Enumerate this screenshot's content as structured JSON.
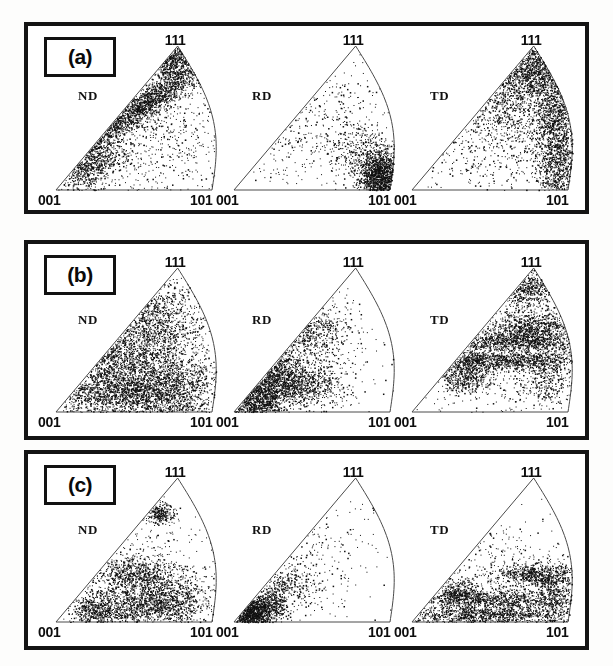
{
  "figure": {
    "type": "inverse-pole-figure-grid",
    "rows": 3,
    "columns": 3,
    "background_color": "#ffffff",
    "frame_color": "#141414",
    "point_color": "#101010"
  },
  "corner_labels": {
    "top": "111",
    "bottom_left": "001",
    "bottom_right": "101"
  },
  "directions": [
    "ND",
    "RD",
    "TD"
  ],
  "panels": [
    {
      "tag": "(a)",
      "plots": [
        {
          "direction": "ND",
          "corner_top": "111",
          "corner_left": "001",
          "corner_right": "101",
          "description": "dense band along the 001-111 edge, saturated near 111 apex, sparse interior"
        },
        {
          "direction": "RD",
          "corner_top": "111",
          "corner_left": "001",
          "corner_right": "101",
          "description": "intense concentration at the 101 corner, very sparse elsewhere"
        },
        {
          "direction": "TD",
          "corner_top": "111",
          "corner_left": "001",
          "corner_right": "101",
          "description": "dense near 111 apex and along the 111-101 curved edge, sparse toward 001"
        }
      ]
    },
    {
      "tag": "(b)",
      "plots": [
        {
          "direction": "ND",
          "corner_top": "111",
          "corner_left": "001",
          "corner_right": "101",
          "description": "patchy clusters spread over the whole triangle, strongest along the 001-101 base"
        },
        {
          "direction": "RD",
          "corner_top": "111",
          "corner_left": "001",
          "corner_right": "101",
          "description": "heavy blobs near the 001 corner with scattered patches toward mid-triangle"
        },
        {
          "direction": "TD",
          "corner_top": "111",
          "corner_left": "001",
          "corner_right": "101",
          "description": "horizontal bands across mid-height plus clusters near 111 and the right edge"
        }
      ]
    },
    {
      "tag": "(c)",
      "plots": [
        {
          "direction": "ND",
          "corner_top": "111",
          "corner_left": "001",
          "corner_right": "101",
          "description": "sparse discrete clusters in the lower half, isolated spot near 111"
        },
        {
          "direction": "RD",
          "corner_top": "111",
          "corner_left": "001",
          "corner_right": "101",
          "description": "tight dark cluster at the 001 corner, very few scattered points elsewhere"
        },
        {
          "direction": "TD",
          "corner_top": "111",
          "corner_left": "001",
          "corner_right": "101",
          "description": "strong horizontal bands along the base and lower-middle, sparse upper region"
        }
      ]
    }
  ],
  "chart_data": {
    "type": "scatter",
    "title": "",
    "xlabel": "",
    "ylabel": "",
    "projection": "stereographic standard triangle",
    "vertices": {
      "001": [
        0,
        0
      ],
      "101": [
        1,
        0
      ],
      "111": [
        0.78,
        1
      ]
    },
    "panels": [
      {
        "tag": "(a)",
        "series": [
          {
            "name": "ND",
            "n_points": 5200,
            "clusters": [
              {
                "cx": 0.5,
                "cy": 0.55,
                "sx": 0.3,
                "sy": 0.05,
                "w": 0.42,
                "rot": 0.62
              },
              {
                "cx": 0.72,
                "cy": 0.92,
                "sx": 0.09,
                "sy": 0.08,
                "w": 0.2
              },
              {
                "cx": 0.22,
                "cy": 0.17,
                "sx": 0.12,
                "sy": 0.07,
                "w": 0.16,
                "rot": 0.62
              },
              {
                "cx": 0.55,
                "cy": 0.4,
                "sx": 0.33,
                "sy": 0.3,
                "w": 0.22
              }
            ]
          },
          {
            "name": "RD",
            "n_points": 2600,
            "clusters": [
              {
                "cx": 0.93,
                "cy": 0.1,
                "sx": 0.07,
                "sy": 0.1,
                "w": 0.64
              },
              {
                "cx": 0.78,
                "cy": 0.3,
                "sx": 0.1,
                "sy": 0.1,
                "w": 0.1
              },
              {
                "cx": 0.45,
                "cy": 0.45,
                "sx": 0.3,
                "sy": 0.3,
                "w": 0.26
              }
            ]
          },
          {
            "name": "TD",
            "n_points": 5000,
            "clusters": [
              {
                "cx": 0.76,
                "cy": 0.88,
                "sx": 0.11,
                "sy": 0.13,
                "w": 0.26
              },
              {
                "cx": 0.92,
                "cy": 0.5,
                "sx": 0.07,
                "sy": 0.26,
                "w": 0.28
              },
              {
                "cx": 0.62,
                "cy": 0.66,
                "sx": 0.17,
                "sy": 0.17,
                "w": 0.18
              },
              {
                "cx": 0.93,
                "cy": 0.14,
                "sx": 0.06,
                "sy": 0.14,
                "w": 0.1
              },
              {
                "cx": 0.55,
                "cy": 0.4,
                "sx": 0.3,
                "sy": 0.28,
                "w": 0.18
              }
            ]
          }
        ]
      },
      {
        "tag": "(b)",
        "series": [
          {
            "name": "ND",
            "n_points": 6200,
            "clusters": [
              {
                "cx": 0.42,
                "cy": 0.13,
                "sx": 0.26,
                "sy": 0.09,
                "w": 0.26
              },
              {
                "cx": 0.72,
                "cy": 0.17,
                "sx": 0.16,
                "sy": 0.11,
                "w": 0.16
              },
              {
                "cx": 0.62,
                "cy": 0.62,
                "sx": 0.15,
                "sy": 0.16,
                "w": 0.16
              },
              {
                "cx": 0.36,
                "cy": 0.38,
                "sx": 0.14,
                "sy": 0.13,
                "w": 0.13
              },
              {
                "cx": 0.55,
                "cy": 0.42,
                "sx": 0.32,
                "sy": 0.3,
                "w": 0.29
              }
            ]
          },
          {
            "name": "RD",
            "n_points": 4200,
            "clusters": [
              {
                "cx": 0.13,
                "cy": 0.1,
                "sx": 0.1,
                "sy": 0.09,
                "w": 0.34
              },
              {
                "cx": 0.28,
                "cy": 0.3,
                "sx": 0.1,
                "sy": 0.1,
                "w": 0.18
              },
              {
                "cx": 0.42,
                "cy": 0.18,
                "sx": 0.13,
                "sy": 0.07,
                "w": 0.16
              },
              {
                "cx": 0.48,
                "cy": 0.58,
                "sx": 0.13,
                "sy": 0.1,
                "w": 0.14
              },
              {
                "cx": 0.4,
                "cy": 0.38,
                "sx": 0.26,
                "sy": 0.26,
                "w": 0.18
              }
            ]
          },
          {
            "name": "TD",
            "n_points": 5200,
            "clusters": [
              {
                "cx": 0.52,
                "cy": 0.36,
                "sx": 0.28,
                "sy": 0.035,
                "w": 0.22
              },
              {
                "cx": 0.62,
                "cy": 0.5,
                "sx": 0.24,
                "sy": 0.035,
                "w": 0.18
              },
              {
                "cx": 0.78,
                "cy": 0.6,
                "sx": 0.13,
                "sy": 0.05,
                "w": 0.12
              },
              {
                "cx": 0.74,
                "cy": 0.86,
                "sx": 0.1,
                "sy": 0.07,
                "w": 0.12
              },
              {
                "cx": 0.34,
                "cy": 0.25,
                "sx": 0.09,
                "sy": 0.07,
                "w": 0.1
              },
              {
                "cx": 0.86,
                "cy": 0.3,
                "sx": 0.09,
                "sy": 0.14,
                "w": 0.1
              },
              {
                "cx": 0.58,
                "cy": 0.45,
                "sx": 0.28,
                "sy": 0.26,
                "w": 0.16
              }
            ]
          }
        ]
      },
      {
        "tag": "(c)",
        "series": [
          {
            "name": "ND",
            "n_points": 3400,
            "clusters": [
              {
                "cx": 0.55,
                "cy": 0.1,
                "sx": 0.2,
                "sy": 0.07,
                "w": 0.26
              },
              {
                "cx": 0.7,
                "cy": 0.2,
                "sx": 0.14,
                "sy": 0.09,
                "w": 0.2
              },
              {
                "cx": 0.26,
                "cy": 0.08,
                "sx": 0.07,
                "sy": 0.06,
                "w": 0.14
              },
              {
                "cx": 0.47,
                "cy": 0.33,
                "sx": 0.11,
                "sy": 0.06,
                "w": 0.14
              },
              {
                "cx": 0.66,
                "cy": 0.76,
                "sx": 0.05,
                "sy": 0.04,
                "w": 0.08
              },
              {
                "cx": 0.55,
                "cy": 0.3,
                "sx": 0.26,
                "sy": 0.22,
                "w": 0.18
              }
            ]
          },
          {
            "name": "RD",
            "n_points": 2400,
            "clusters": [
              {
                "cx": 0.1,
                "cy": 0.06,
                "sx": 0.07,
                "sy": 0.06,
                "w": 0.52
              },
              {
                "cx": 0.22,
                "cy": 0.12,
                "sx": 0.07,
                "sy": 0.06,
                "w": 0.18
              },
              {
                "cx": 0.34,
                "cy": 0.26,
                "sx": 0.08,
                "sy": 0.07,
                "w": 0.1
              },
              {
                "cx": 0.4,
                "cy": 0.4,
                "sx": 0.26,
                "sy": 0.26,
                "w": 0.2
              }
            ]
          },
          {
            "name": "TD",
            "n_points": 3800,
            "clusters": [
              {
                "cx": 0.46,
                "cy": 0.05,
                "sx": 0.3,
                "sy": 0.035,
                "w": 0.3
              },
              {
                "cx": 0.56,
                "cy": 0.16,
                "sx": 0.26,
                "sy": 0.035,
                "w": 0.22
              },
              {
                "cx": 0.8,
                "cy": 0.33,
                "sx": 0.13,
                "sy": 0.04,
                "w": 0.16
              },
              {
                "cx": 0.3,
                "cy": 0.2,
                "sx": 0.07,
                "sy": 0.05,
                "w": 0.1
              },
              {
                "cx": 0.6,
                "cy": 0.3,
                "sx": 0.26,
                "sy": 0.22,
                "w": 0.12
              },
              {
                "cx": 0.9,
                "cy": 0.2,
                "sx": 0.06,
                "sy": 0.1,
                "w": 0.1
              }
            ]
          }
        ]
      }
    ]
  }
}
